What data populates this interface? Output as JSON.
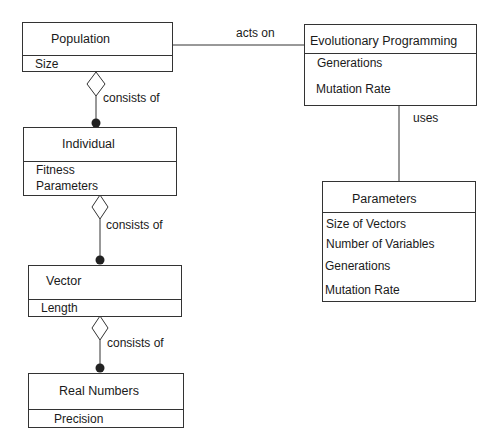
{
  "diagram": {
    "type": "uml-class-diagram",
    "classes": {
      "population": {
        "name": "Population",
        "attributes": [
          "Size"
        ]
      },
      "individual": {
        "name": "Individual",
        "attributes": [
          "Fitness",
          "Parameters"
        ]
      },
      "vector": {
        "name": "Vector",
        "attributes": [
          "Length"
        ]
      },
      "real_numbers": {
        "name": "Real Numbers",
        "attributes": [
          "Precision"
        ]
      },
      "evolutionary_programming": {
        "name": "Evolutionary Programming",
        "attributes": [
          "Generations",
          "Mutation Rate"
        ]
      },
      "parameters": {
        "name": "Parameters",
        "attributes": [
          "Size of Vectors",
          "Number of Variables",
          "Generations",
          "Mutation Rate"
        ]
      }
    },
    "relations": [
      {
        "from": "Population",
        "to": "Evolutionary Programming",
        "label": "acts on",
        "kind": "association"
      },
      {
        "from": "Evolutionary Programming",
        "to": "Parameters",
        "label": "uses",
        "kind": "association"
      },
      {
        "from": "Population",
        "to": "Individual",
        "label": "consists of",
        "kind": "aggregation"
      },
      {
        "from": "Individual",
        "to": "Vector",
        "label": "consists of",
        "kind": "aggregation"
      },
      {
        "from": "Vector",
        "to": "Real Numbers",
        "label": "consists of",
        "kind": "aggregation"
      }
    ]
  },
  "labels": {
    "acts_on": "acts on",
    "uses": "uses",
    "consists_of_1": "consists of",
    "consists_of_2": "consists of",
    "consists_of_3": "consists of"
  }
}
